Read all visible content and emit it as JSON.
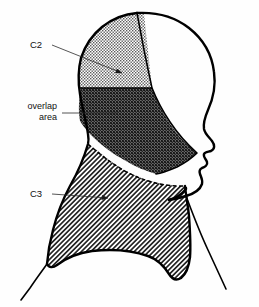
{
  "figure": {
    "view": "lateral profile, facing right",
    "background_color": "#fefefe",
    "outline_color": "#000000"
  },
  "labels": [
    {
      "id": "c2",
      "text": "C2",
      "align": "left",
      "text_x": 30,
      "text_y": 48,
      "leader": "M 52 45 L 128 75",
      "arrow_at": [
        128,
        75
      ],
      "target_region": "c2-region"
    },
    {
      "id": "overlap",
      "line1": "overlap",
      "line2": "area",
      "align": "right",
      "text_x": 57,
      "text_y": 109,
      "leader": "M 62 113 L 118 113",
      "arrow_at": [
        118,
        113
      ],
      "target_region": "overlap-region"
    },
    {
      "id": "c3",
      "text": "C3",
      "align": "left",
      "text_x": 30,
      "text_y": 197,
      "leader": "M 52 194 L 114 199",
      "arrow_at": [
        114,
        199
      ],
      "target_region": "c3-region"
    }
  ],
  "regions": [
    {
      "id": "c2-region",
      "name": "C2 dermatome",
      "label": "C2",
      "pattern": "fine-stipple",
      "shade": "light",
      "description": "posterior and vertex scalp"
    },
    {
      "id": "overlap-region",
      "name": "overlap area",
      "label": "overlap area",
      "pattern": "cross-hatch-dense",
      "shade": "dark",
      "description": "occipital and upper posterior neck where C2 and C3 overlap"
    },
    {
      "id": "c3-region",
      "name": "C3 dermatome",
      "label": "C3",
      "pattern": "diagonal-hatch",
      "shade": "medium",
      "description": "lower neck, submandibular region and supraclavicular shoulder"
    },
    {
      "id": "unshaded-region",
      "name": "unshaded anterior scalp and face",
      "label": "",
      "pattern": "none",
      "shade": "white",
      "description": "trigeminal territory, not labelled"
    }
  ],
  "anatomy": {
    "head_outline": "lateral profile of head with forehead, nose, lips, chin",
    "vertex_divider": "vertical line at skull vertex separating C2 from unshaded scalp",
    "c2_overlap_boundary": "solid horizontal line across the occiput",
    "overlap_c3_boundary": "dashed line running from occiput down across the neck",
    "neck_and_shoulder": "anterior neck line descending to chest, trapezius shoulder contour"
  }
}
